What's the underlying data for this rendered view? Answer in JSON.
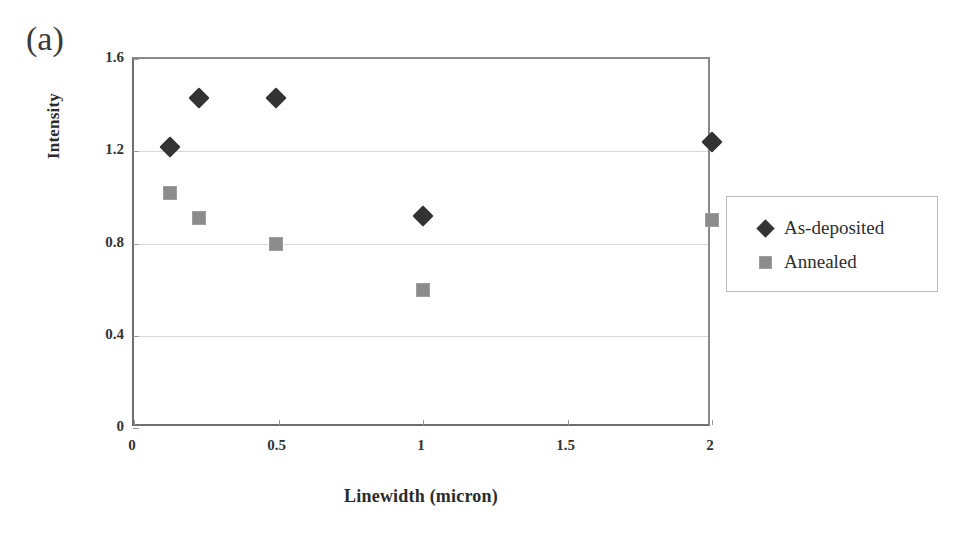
{
  "figure": {
    "panel_label": "(a)"
  },
  "legend": {
    "position": "right",
    "entries": [
      {
        "label": "As-deposited",
        "marker": "diamond",
        "color": "#333333"
      },
      {
        "label": "Annealed",
        "marker": "square",
        "color": "#8c8c8c"
      }
    ]
  },
  "chart_data": {
    "type": "scatter",
    "title": "(a)",
    "xlabel": "Linewidth (micron)",
    "ylabel": "Intensity",
    "xlim": [
      0,
      2
    ],
    "ylim": [
      0,
      1.6
    ],
    "xticks": [
      0,
      0.5,
      1,
      1.5,
      2
    ],
    "xticklabels": [
      "0",
      "0.5",
      "1",
      "1.5",
      "2"
    ],
    "yticks": [
      0,
      0.4,
      0.8,
      1.2,
      1.6
    ],
    "yticklabels": [
      "0",
      "0.4",
      "0.8",
      "1.2",
      "1.6"
    ],
    "grid": "horizontal",
    "gridlines_y": [
      0.4,
      0.8,
      1.2
    ],
    "legend_position": "right outside",
    "series": [
      {
        "name": "As-deposited",
        "marker": "diamond",
        "color": "#333333",
        "points": [
          {
            "x": 0.125,
            "y": 1.22
          },
          {
            "x": 0.225,
            "y": 1.43
          },
          {
            "x": 0.49,
            "y": 1.43
          },
          {
            "x": 1.0,
            "y": 0.92
          },
          {
            "x": 2.0,
            "y": 1.24
          }
        ]
      },
      {
        "name": "Annealed",
        "marker": "square",
        "color": "#8c8c8c",
        "points": [
          {
            "x": 0.125,
            "y": 1.02
          },
          {
            "x": 0.225,
            "y": 0.91
          },
          {
            "x": 0.49,
            "y": 0.8
          },
          {
            "x": 1.0,
            "y": 0.6
          },
          {
            "x": 2.0,
            "y": 0.9
          }
        ]
      }
    ]
  }
}
